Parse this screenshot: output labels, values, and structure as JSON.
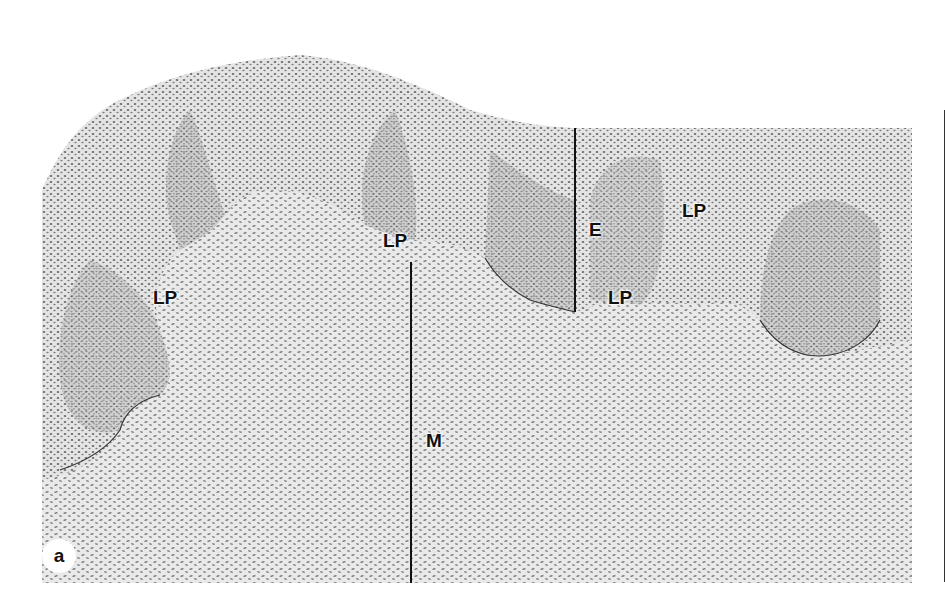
{
  "figure": {
    "panel_label": "a",
    "labels": {
      "lp_left": "LP",
      "lp_center": "LP",
      "lp_right_upper": "LP",
      "lp_right_lower": "LP",
      "epithelium": "E",
      "mucosa": "M"
    },
    "colors": {
      "background": "#ffffff",
      "tissue_light": "#d9d9d9",
      "tissue_mid": "#9a9a9a",
      "tissue_dark": "#4a4a4a",
      "line": "#111111"
    }
  }
}
